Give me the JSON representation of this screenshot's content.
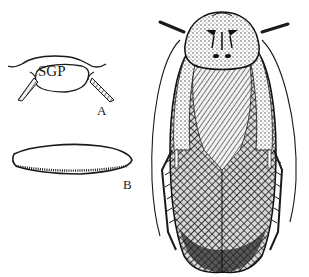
{
  "figure": {
    "panels": [
      {
        "id": "A",
        "label": "A",
        "inner_label": "SGP",
        "depicts": "subgenital plate with styli"
      },
      {
        "id": "B",
        "label": "B",
        "depicts": "tegmen / wing with setae along lower margin"
      },
      {
        "id": "main",
        "label": "",
        "depicts": "whole insect, dorsal view"
      }
    ]
  },
  "colors": {
    "ink": "#1a1a1a",
    "background": "#ffffff",
    "stipple": "#555555"
  }
}
